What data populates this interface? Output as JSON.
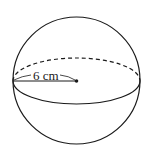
{
  "diagram": {
    "shape": "sphere",
    "radius_label": "6 cm",
    "colors": {
      "stroke": "#1a1a1a",
      "background": "#ffffff"
    }
  }
}
